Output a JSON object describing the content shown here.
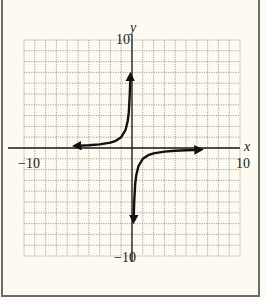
{
  "chart_data": {
    "type": "line",
    "title": "",
    "xlabel": "x",
    "ylabel": "y",
    "xlim": [
      -10,
      10
    ],
    "ylim": [
      -10,
      10
    ],
    "grid": true,
    "grid_step": 1,
    "tick_labels": {
      "x_min": "−10",
      "x_max": "10",
      "y_min": "−10",
      "y_max": "10"
    },
    "function": "y = -1/x",
    "series": [
      {
        "name": "left-branch",
        "x": [
          -5.2,
          -4,
          -3,
          -2,
          -1.5,
          -1,
          -0.6,
          -0.4,
          -0.3,
          -0.2,
          -0.15
        ],
        "y": [
          0.19,
          0.25,
          0.33,
          0.5,
          0.67,
          1.0,
          1.67,
          2.5,
          3.3,
          5.0,
          6.7
        ],
        "arrows": "both"
      },
      {
        "name": "right-branch",
        "x": [
          0.15,
          0.2,
          0.3,
          0.4,
          0.6,
          1,
          1.5,
          2,
          3,
          4,
          5,
          6.3
        ],
        "y": [
          -6.7,
          -5.0,
          -3.3,
          -2.5,
          -1.67,
          -1.0,
          -0.67,
          -0.5,
          -0.33,
          -0.25,
          -0.2,
          -0.16
        ],
        "arrows": "both"
      }
    ]
  },
  "colors": {
    "background": "#fdfbf1",
    "grid": "#8a8a8a",
    "axis": "#1a1a1a",
    "curve": "#111111",
    "frame": "#6b6b6b"
  }
}
